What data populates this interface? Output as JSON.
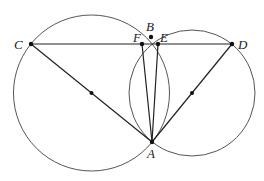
{
  "figure": {
    "points": {
      "C": {
        "label": "C",
        "x": 31,
        "y": 44,
        "label_x": 14,
        "label_y": 49
      },
      "F": {
        "label": "F",
        "x": 142,
        "y": 44,
        "label_x": 133,
        "label_y": 41
      },
      "B": {
        "label": "B",
        "x": 151,
        "y": 37,
        "label_x": 147,
        "label_y": 30
      },
      "E": {
        "label": "E",
        "x": 158,
        "y": 44,
        "label_x": 160,
        "label_y": 41
      },
      "D": {
        "label": "D",
        "x": 232,
        "y": 44,
        "label_x": 238,
        "label_y": 49
      },
      "A": {
        "label": "A",
        "x": 152,
        "y": 142,
        "label_x": 147,
        "label_y": 158
      },
      "O1": {
        "label": "",
        "x": 91.5,
        "y": 93
      },
      "O2": {
        "label": "",
        "x": 192,
        "y": 93
      }
    },
    "circles": [
      {
        "name": "circle-diameter-CA",
        "cx": 91.5,
        "cy": 93,
        "r": 78
      },
      {
        "name": "circle-diameter-AD",
        "cx": 192,
        "cy": 93,
        "r": 63
      }
    ],
    "segments": [
      "CD",
      "CA",
      "DA",
      "FA",
      "EA"
    ]
  }
}
